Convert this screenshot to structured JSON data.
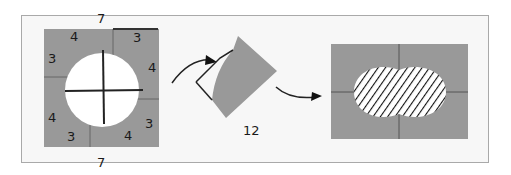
{
  "diagram": {
    "left_figure": {
      "top_label": "7",
      "bottom_label": "7",
      "piece_labels": [
        "4",
        "3",
        "3",
        "4",
        "4",
        "3",
        "3",
        "4"
      ]
    },
    "middle_figure": {
      "label": "12"
    },
    "right_figure": {
      "fill_pattern": "hatched oval"
    },
    "colors": {
      "piece_fill": "#999999",
      "frame_bg": "#f7f7f7",
      "frame_border": "#a9a9a9",
      "line": "#222222"
    }
  }
}
